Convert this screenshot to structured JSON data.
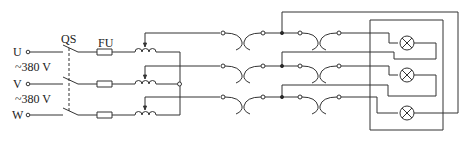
{
  "diagram": {
    "terminals": [
      {
        "label": "U",
        "y": 52
      },
      {
        "label": "V",
        "y": 84
      },
      {
        "label": "W",
        "y": 115
      }
    ],
    "voltage_labels": [
      {
        "text": "~380 V",
        "y": 62
      },
      {
        "text": "~380 V",
        "y": 94
      }
    ],
    "switch_label": "QS",
    "fuse_label": "FU",
    "colors": {
      "line": "#333333",
      "background": "#ffffff"
    },
    "components": {
      "switch": "three-pole knife switch QS (ganged, dashed link)",
      "fuses": 3,
      "autotransformers": 3,
      "connectors": 6,
      "lamps": 3
    }
  }
}
